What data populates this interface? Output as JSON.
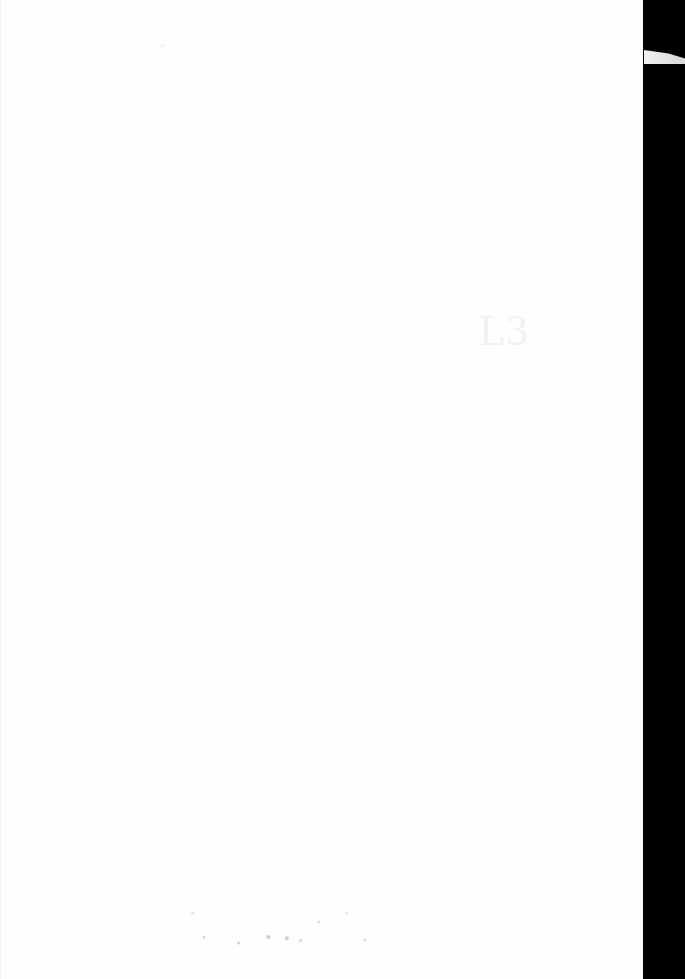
{
  "document": {
    "type": "scanned-page",
    "content": "",
    "bleed_through_header": "· · · ·",
    "bleed_through_glyph": "L3"
  },
  "colors": {
    "page": "#fefefe",
    "scan_border": "#000000"
  }
}
